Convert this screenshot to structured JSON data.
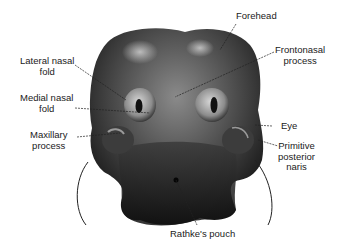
{
  "diagram": {
    "colors": {
      "background": "#ffffff",
      "text": "#1a1a1a",
      "head_dark": "#1c1c1c",
      "head_mid": "#5a5a5a",
      "head_light": "#b8b8b8",
      "leader_line": "#222222"
    },
    "labels": [
      {
        "id": "forehead",
        "lines": [
          "Forehead"
        ]
      },
      {
        "id": "frontonasal",
        "lines": [
          "Frontonasal",
          "process"
        ]
      },
      {
        "id": "lateral-nasal",
        "lines": [
          "Lateral nasal",
          "fold"
        ]
      },
      {
        "id": "medial-nasal",
        "lines": [
          "Medial nasal",
          "fold"
        ]
      },
      {
        "id": "maxillary",
        "lines": [
          "Maxillary",
          "process"
        ]
      },
      {
        "id": "eye",
        "lines": [
          "Eye"
        ]
      },
      {
        "id": "primitive-naris",
        "lines": [
          "Primitive",
          "posterior",
          "naris"
        ]
      },
      {
        "id": "rathke",
        "lines": [
          "Rathke's pouch"
        ]
      }
    ]
  }
}
